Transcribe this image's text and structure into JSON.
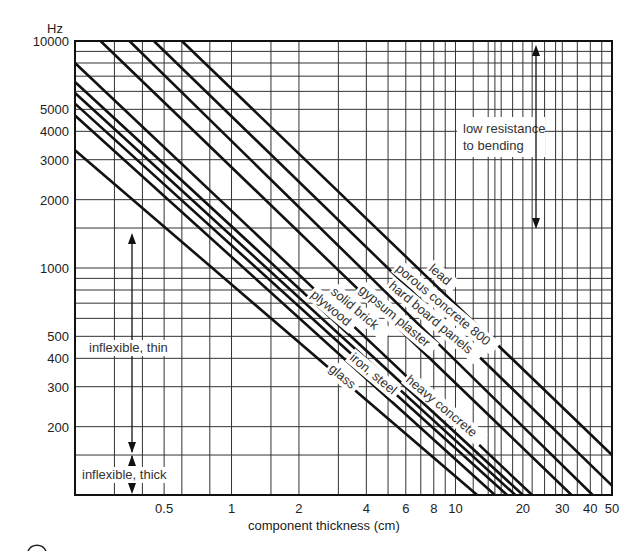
{
  "chart_data": {
    "type": "line",
    "title": "",
    "xlabel": "component thickness (cm)",
    "ylabel": "Hz",
    "xscale": "log",
    "yscale": "log",
    "xlim": [
      0.2,
      50
    ],
    "ylim": [
      100,
      10000
    ],
    "grid": true,
    "x_ticks": [
      {
        "v": 0.5,
        "label": "0.5"
      },
      {
        "v": 1,
        "label": "1"
      },
      {
        "v": 2,
        "label": "2"
      },
      {
        "v": 4,
        "label": "4"
      },
      {
        "v": 6,
        "label": "6"
      },
      {
        "v": 8,
        "label": "8"
      },
      {
        "v": 10,
        "label": "10"
      },
      {
        "v": 20,
        "label": "20"
      },
      {
        "v": 30,
        "label": "30"
      },
      {
        "v": 40,
        "label": "40"
      },
      {
        "v": 50,
        "label": "50"
      }
    ],
    "y_ticks": [
      {
        "v": 10000,
        "label": "10000"
      },
      {
        "v": 5000,
        "label": "5000"
      },
      {
        "v": 4000,
        "label": "4000"
      },
      {
        "v": 3000,
        "label": "3000"
      },
      {
        "v": 2000,
        "label": "2000"
      },
      {
        "v": 1000,
        "label": "1000"
      },
      {
        "v": 500,
        "label": "500"
      },
      {
        "v": 400,
        "label": "400"
      },
      {
        "v": 300,
        "label": "300"
      },
      {
        "v": 200,
        "label": "200"
      }
    ],
    "x_grid": [
      0.3,
      0.4,
      0.5,
      0.6,
      0.8,
      1,
      1.5,
      2,
      3,
      4,
      5,
      6,
      7,
      8,
      9,
      10,
      12,
      14,
      15,
      16,
      18,
      20,
      22,
      25,
      28,
      30,
      35,
      40,
      45
    ],
    "y_grid": [
      10000,
      9000,
      8000,
      7000,
      6000,
      5000,
      4000,
      3000,
      2000,
      1500,
      1000,
      900,
      800,
      700,
      600,
      500,
      400,
      300,
      200,
      150
    ],
    "series": [
      {
        "name": "glass",
        "label": "glass",
        "x": [
          0.2,
          12.5
        ],
        "y": [
          3300,
          100
        ]
      },
      {
        "name": "iron-steel",
        "label": "iron, steel",
        "x": [
          0.2,
          15
        ],
        "y": [
          4700,
          100
        ]
      },
      {
        "name": "plywood",
        "label": "plywood",
        "x": [
          0.2,
          17
        ],
        "y": [
          5300,
          100
        ]
      },
      {
        "name": "solid-brick",
        "label": "solid brick",
        "x": [
          0.2,
          18.5
        ],
        "y": [
          5900,
          100
        ]
      },
      {
        "name": "heavy-concrete",
        "label": "heavy concrete",
        "x": [
          0.2,
          20
        ],
        "y": [
          6600,
          100
        ]
      },
      {
        "name": "gypsum-plaster",
        "label": "gypsum plaster",
        "x": [
          0.2,
          22
        ],
        "y": [
          8000,
          100
        ]
      },
      {
        "name": "hard-board-panels",
        "label": "hard board panels",
        "x": [
          0.26,
          33
        ],
        "y": [
          10000,
          100
        ]
      },
      {
        "name": "porous-concrete-800",
        "label": "porous concrete 800",
        "x": [
          0.35,
          41
        ],
        "y": [
          10000,
          100
        ]
      },
      {
        "name": "lead",
        "label": "lead",
        "x": [
          0.6,
          50
        ],
        "y": [
          10000,
          150
        ]
      },
      {
        "name": "extra-1",
        "label": "",
        "x": [
          0.45,
          50
        ],
        "y": [
          10000,
          110
        ]
      }
    ],
    "annotations": [
      {
        "text": "low resistance to bending",
        "lines": [
          "low resistance",
          "to bending"
        ]
      },
      {
        "text": "inflexible, thin"
      },
      {
        "text": "inflexible, thick"
      }
    ]
  },
  "axis": {
    "y_unit": "Hz",
    "x_title": "component thickness (cm)"
  },
  "labels": {
    "low_resistance_1": "low resistance",
    "low_resistance_2": "to bending",
    "inflexible_thin": "inflexible, thin",
    "inflexible_thick": "inflexible, thick",
    "lead": "lead",
    "porous": "porous concrete 800",
    "hardboard": "hard board panels",
    "gypsum": "gypsum plaster",
    "solidbrick": "solid brick",
    "plywood": "plywood",
    "iron": "iron, steel",
    "glass": "glass",
    "heavy": "heavy concrete"
  }
}
